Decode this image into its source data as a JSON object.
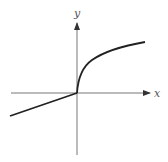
{
  "diagram": {
    "type": "function-graph",
    "axes": {
      "x_label": "x",
      "y_label": "y"
    },
    "curve": {
      "description": "piecewise: linear for x<0, square-root for x>=0",
      "left_segment": {
        "from": [
          -1.0,
          -0.34
        ],
        "to": [
          0,
          0
        ]
      },
      "right_segment": "sqrt-like increasing curve from origin"
    },
    "colors": {
      "axes": "#555555",
      "curve": "#222222",
      "background": "#ffffff"
    }
  }
}
